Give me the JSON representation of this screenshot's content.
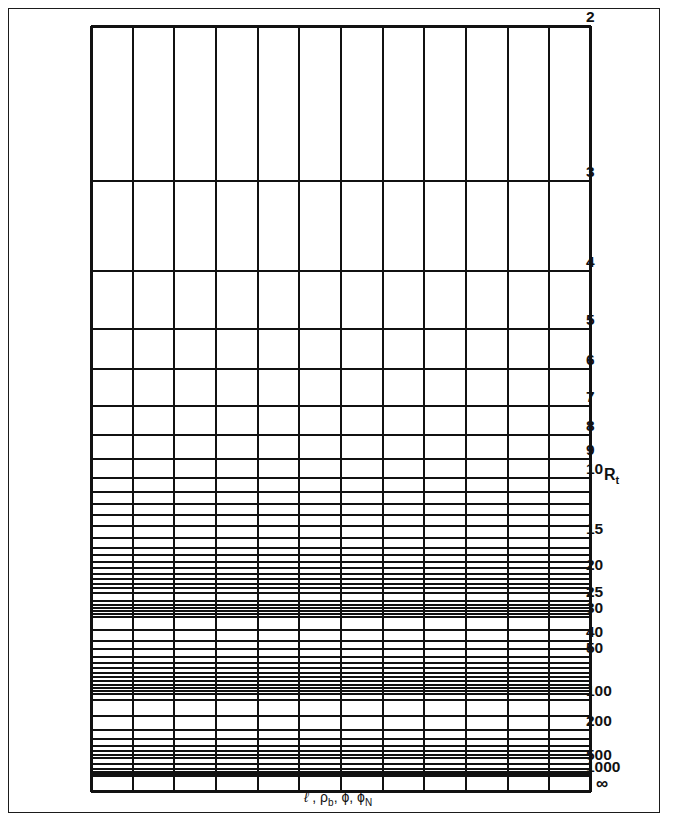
{
  "figure": {
    "type": "nomogram-grid",
    "y_axis_name": "Rt",
    "y_axis_name_base": "R",
    "y_axis_name_sub": "t",
    "x_axis_caption_parts": {
      "l": "ℓ",
      "sep1": " , ",
      "rho": "ρ",
      "rho_sub": "b",
      "sep2": ", ",
      "phi": "ϕ",
      "sep3": ", ",
      "phi_n": "ϕ",
      "phi_n_sub": "N"
    },
    "x_axis_caption": "ℓ , ρb, ϕ, ϕN",
    "infinity_symbol": "∞",
    "columns": 12,
    "ink_color": "#111111",
    "background_color": "#ffffff"
  },
  "chart_data": {
    "type": "table",
    "title": "",
    "subtitle": "",
    "xlabel": "ℓ , ρb, ϕ, ϕN",
    "ylabel": "Rt",
    "grid": true,
    "legend": null,
    "scale": "reciprocal (1/Rt) vertical, linear horizontal",
    "ylim": [
      2,
      "∞"
    ],
    "y_major_labels": [
      "2",
      "3",
      "4",
      "5",
      "6",
      "7",
      "8",
      "9",
      "10",
      "15",
      "20",
      "25",
      "30",
      "40",
      "50",
      "100",
      "200",
      "500",
      "1000",
      "∞"
    ],
    "y_major_values": [
      2,
      3,
      4,
      5,
      6,
      7,
      8,
      9,
      10,
      15,
      20,
      25,
      30,
      40,
      50,
      100,
      200,
      500,
      1000,
      null
    ],
    "y_major_pixels": [
      17,
      172,
      262,
      320,
      360,
      397,
      426,
      450,
      469,
      529,
      565,
      592,
      608,
      632,
      648,
      691,
      721,
      755,
      767,
      783
    ],
    "y_minor_values": [
      11,
      12,
      13,
      14,
      16,
      17,
      18,
      19,
      21,
      22,
      23,
      24,
      26,
      27,
      28,
      29,
      35,
      45,
      55,
      60,
      65,
      70,
      75,
      80,
      85,
      90,
      95,
      150,
      250,
      300,
      350,
      400,
      450,
      600,
      700,
      800,
      900
    ],
    "y_minor_pixels": [
      483,
      495,
      506,
      517,
      539,
      546,
      553,
      559,
      570,
      575,
      579,
      584,
      596,
      599,
      602,
      605,
      621,
      640,
      654,
      659,
      664,
      668,
      672,
      676,
      679,
      682,
      685,
      707,
      730,
      737,
      742,
      746,
      749,
      760,
      763,
      765,
      766
    ],
    "x_gridline_count": 13,
    "x_gridline_pixels": [
      0,
      41.7,
      83.3,
      125,
      166.7,
      208.3,
      250,
      291.7,
      333.3,
      375,
      416.7,
      458.3,
      500
    ]
  }
}
